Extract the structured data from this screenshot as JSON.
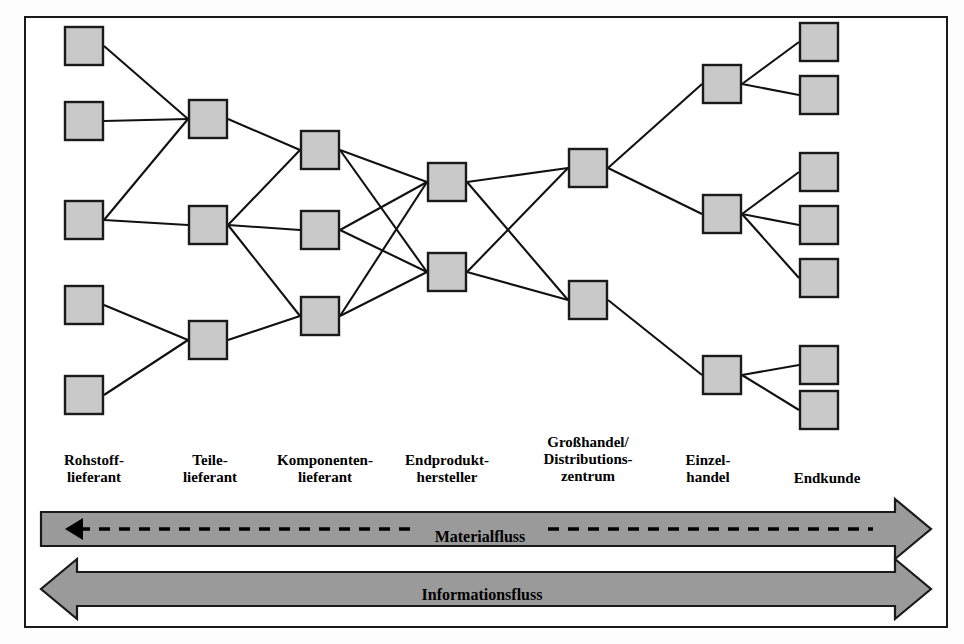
{
  "figure": {
    "title_implicit": "Supply Chain Netzwerk",
    "border_color": "#1a1a1a",
    "node_fill": "#c9c9c9",
    "node_stroke": "#1a1a1a",
    "edge_color": "#111111",
    "band_fill": "#9a9a9a",
    "band_stroke": "#1a1a1a",
    "background": "#ffffff"
  },
  "columns": [
    {
      "id": "rohstofflieferant",
      "label": "Rohstoff-\nlieferant",
      "label_x": 42,
      "label_y": 452,
      "label_w": 104,
      "node_count": 5
    },
    {
      "id": "teilelieferant",
      "label": "Teile-\nlieferant",
      "label_x": 160,
      "label_y": 452,
      "label_w": 100,
      "node_count": 3
    },
    {
      "id": "komponentenlieferant",
      "label": "Komponenten-\nlieferant",
      "label_x": 258,
      "label_y": 452,
      "label_w": 134,
      "node_count": 3
    },
    {
      "id": "endprodukthersteller",
      "label": "Endprodukt-\nhersteller",
      "label_x": 384,
      "label_y": 452,
      "label_w": 126,
      "node_count": 2
    },
    {
      "id": "grosshandel",
      "label": "Großhandel/\nDistributions-\nzentrum",
      "label_x": 520,
      "label_y": 434,
      "label_w": 136,
      "node_count": 2
    },
    {
      "id": "einzelhandel",
      "label": "Einzel-\nhandel",
      "label_x": 660,
      "label_y": 452,
      "label_w": 96,
      "node_count": 3
    },
    {
      "id": "endkunde",
      "label": "Endkunde",
      "label_x": 772,
      "label_y": 470,
      "label_w": 110,
      "node_count": 7
    }
  ],
  "nodes": [
    {
      "id": "r1",
      "col": 0,
      "x": 64,
      "y": 26,
      "w": 40,
      "h": 40
    },
    {
      "id": "r2",
      "col": 0,
      "x": 64,
      "y": 101,
      "w": 40,
      "h": 40
    },
    {
      "id": "r3",
      "col": 0,
      "x": 64,
      "y": 200,
      "w": 40,
      "h": 40
    },
    {
      "id": "r4",
      "col": 0,
      "x": 64,
      "y": 285,
      "w": 40,
      "h": 40
    },
    {
      "id": "r5",
      "col": 0,
      "x": 64,
      "y": 375,
      "w": 40,
      "h": 40
    },
    {
      "id": "t1",
      "col": 1,
      "x": 188,
      "y": 99,
      "w": 40,
      "h": 40
    },
    {
      "id": "t2",
      "col": 1,
      "x": 188,
      "y": 205,
      "w": 40,
      "h": 40
    },
    {
      "id": "t3",
      "col": 1,
      "x": 188,
      "y": 320,
      "w": 40,
      "h": 40
    },
    {
      "id": "k1",
      "col": 2,
      "x": 300,
      "y": 130,
      "w": 40,
      "h": 40
    },
    {
      "id": "k2",
      "col": 2,
      "x": 300,
      "y": 210,
      "w": 40,
      "h": 40
    },
    {
      "id": "k3",
      "col": 2,
      "x": 300,
      "y": 296,
      "w": 40,
      "h": 40
    },
    {
      "id": "e1",
      "col": 3,
      "x": 427,
      "y": 162,
      "w": 40,
      "h": 40
    },
    {
      "id": "e2",
      "col": 3,
      "x": 427,
      "y": 252,
      "w": 40,
      "h": 40
    },
    {
      "id": "g1",
      "col": 4,
      "x": 568,
      "y": 148,
      "w": 40,
      "h": 40
    },
    {
      "id": "g2",
      "col": 4,
      "x": 568,
      "y": 280,
      "w": 40,
      "h": 40
    },
    {
      "id": "h1",
      "col": 5,
      "x": 702,
      "y": 64,
      "w": 40,
      "h": 40
    },
    {
      "id": "h2",
      "col": 5,
      "x": 702,
      "y": 194,
      "w": 40,
      "h": 40
    },
    {
      "id": "h3",
      "col": 5,
      "x": 702,
      "y": 355,
      "w": 40,
      "h": 40
    },
    {
      "id": "c1",
      "col": 6,
      "x": 799,
      "y": 22,
      "w": 40,
      "h": 40
    },
    {
      "id": "c2",
      "col": 6,
      "x": 799,
      "y": 75,
      "w": 40,
      "h": 40
    },
    {
      "id": "c3",
      "col": 6,
      "x": 799,
      "y": 152,
      "w": 40,
      "h": 40
    },
    {
      "id": "c4",
      "col": 6,
      "x": 799,
      "y": 205,
      "w": 40,
      "h": 40
    },
    {
      "id": "c5",
      "col": 6,
      "x": 799,
      "y": 258,
      "w": 40,
      "h": 40
    },
    {
      "id": "c6",
      "col": 6,
      "x": 799,
      "y": 345,
      "w": 40,
      "h": 40
    },
    {
      "id": "c7",
      "col": 6,
      "x": 799,
      "y": 390,
      "w": 40,
      "h": 40
    }
  ],
  "edges": [
    {
      "from": "r1",
      "to": "t1"
    },
    {
      "from": "r2",
      "to": "t1"
    },
    {
      "from": "r3",
      "to": "t1"
    },
    {
      "from": "r3",
      "to": "t2"
    },
    {
      "from": "r4",
      "to": "t3"
    },
    {
      "from": "r5",
      "to": "t3"
    },
    {
      "from": "t1",
      "to": "k1"
    },
    {
      "from": "t2",
      "to": "k2"
    },
    {
      "from": "t2",
      "to": "k1"
    },
    {
      "from": "t2",
      "to": "k3"
    },
    {
      "from": "t3",
      "to": "k3"
    },
    {
      "from": "k1",
      "to": "e1"
    },
    {
      "from": "k1",
      "to": "e2"
    },
    {
      "from": "k2",
      "to": "e1"
    },
    {
      "from": "k2",
      "to": "e2"
    },
    {
      "from": "k3",
      "to": "e1"
    },
    {
      "from": "k3",
      "to": "e2"
    },
    {
      "from": "e1",
      "to": "g1"
    },
    {
      "from": "e1",
      "to": "g2"
    },
    {
      "from": "e2",
      "to": "g1"
    },
    {
      "from": "e2",
      "to": "g2"
    },
    {
      "from": "g1",
      "to": "h1"
    },
    {
      "from": "g1",
      "to": "h2"
    },
    {
      "from": "g2",
      "to": "h3"
    },
    {
      "from": "h1",
      "to": "c1"
    },
    {
      "from": "h1",
      "to": "c2"
    },
    {
      "from": "h2",
      "to": "c3"
    },
    {
      "from": "h2",
      "to": "c4"
    },
    {
      "from": "h2",
      "to": "c5"
    },
    {
      "from": "h3",
      "to": "c6"
    },
    {
      "from": "h3",
      "to": "c7"
    }
  ],
  "bands": [
    {
      "id": "materialfluss",
      "label": "Materialfluss",
      "label_x": 420,
      "label_y": 528,
      "label_w": 120,
      "direction": "right",
      "x": 41,
      "y": 512,
      "width": 890,
      "height": 34,
      "inner_dashed": true,
      "inner_arrow": "left"
    },
    {
      "id": "informationsfluss",
      "label": "Informationsfluss",
      "label_x": 412,
      "label_y": 586,
      "label_w": 140,
      "direction": "both",
      "x": 41,
      "y": 572,
      "width": 890,
      "height": 34,
      "inner_dashed": false,
      "inner_arrow": "none"
    }
  ]
}
